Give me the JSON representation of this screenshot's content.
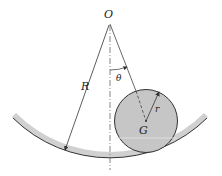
{
  "diagram": {
    "labels": {
      "center": "O",
      "large_radius": "R",
      "angle": "θ",
      "small_radius": "r",
      "mass_center": "G"
    },
    "colors": {
      "disk_fill": "#c6c6c6",
      "stroke": "#333333",
      "surface_shadow": "#bdbdbd"
    }
  }
}
